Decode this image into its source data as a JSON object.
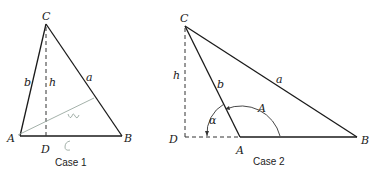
{
  "figure": {
    "case1": {
      "caption": "Case 1",
      "vertices": {
        "C": "C",
        "A": "A",
        "B": "B",
        "D": "D"
      },
      "sides": {
        "a": "a",
        "b": "b",
        "h": "h"
      },
      "annotations": {
        "scribble_1": "ᔕ",
        "scribble_2": "c"
      }
    },
    "case2": {
      "caption": "Case 2",
      "vertices": {
        "C": "C",
        "A": "A",
        "B": "B",
        "D": "D"
      },
      "sides": {
        "a": "a",
        "b": "b",
        "h": "h"
      },
      "angles": {
        "alpha": "α",
        "A": "A"
      }
    }
  }
}
